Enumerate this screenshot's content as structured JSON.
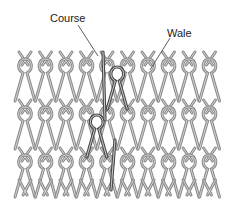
{
  "diagram": {
    "type": "knit-fabric-structure",
    "labels": {
      "course": "Course",
      "wale": "Wale"
    },
    "colors": {
      "yarn": "#8a8a8a",
      "yarn_edge": "#5e5e5e",
      "highlight": "#4a4a4a",
      "leader": "#333333",
      "background": "#ffffff"
    },
    "grid": {
      "columns": 10,
      "rows": 3
    }
  }
}
